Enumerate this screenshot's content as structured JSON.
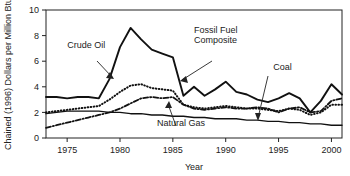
{
  "chart_data": {
    "type": "line",
    "title": "",
    "xlabel": "Year",
    "ylabel": "Chained (1996) Dollars per Million Btu",
    "xlim": [
      1973,
      2001
    ],
    "ylim": [
      0,
      10
    ],
    "xticks": [
      1975,
      1980,
      1985,
      1990,
      1995,
      2000
    ],
    "yticks": [
      0,
      2,
      4,
      6,
      8,
      10
    ],
    "xtick_labels": [
      "1975",
      "1980",
      "1985",
      "1990",
      "1995",
      "2000"
    ],
    "ytick_labels": [
      "0",
      "2",
      "4",
      "6",
      "8",
      "10"
    ],
    "grid": false,
    "legend": "annotations",
    "x": [
      1973,
      1974,
      1975,
      1976,
      1977,
      1978,
      1979,
      1980,
      1981,
      1982,
      1983,
      1984,
      1985,
      1986,
      1987,
      1988,
      1989,
      1990,
      1991,
      1992,
      1993,
      1994,
      1995,
      1996,
      1997,
      1998,
      1999,
      2000,
      2001
    ],
    "series": [
      {
        "name": "Crude Oil",
        "style": "solid-thick",
        "values": [
          3.2,
          3.2,
          3.1,
          3.2,
          3.2,
          3.1,
          4.6,
          7.1,
          8.6,
          7.7,
          6.9,
          6.6,
          6.3,
          3.3,
          4.0,
          3.3,
          3.8,
          4.4,
          3.6,
          3.4,
          3.0,
          2.8,
          3.1,
          3.5,
          3.1,
          2.0,
          2.9,
          4.2,
          3.4
        ]
      },
      {
        "name": "Fossil Fuel Composite",
        "style": "dotted",
        "values": [
          2.0,
          2.1,
          2.2,
          2.3,
          2.4,
          2.5,
          3.0,
          3.6,
          4.1,
          4.2,
          3.9,
          3.8,
          3.7,
          2.6,
          2.4,
          2.3,
          2.4,
          2.5,
          2.4,
          2.3,
          2.3,
          2.2,
          2.1,
          2.3,
          2.2,
          1.8,
          2.0,
          2.6,
          2.6
        ]
      },
      {
        "name": "Natural Gas",
        "style": "dash-dot",
        "values": [
          0.8,
          1.0,
          1.2,
          1.4,
          1.6,
          1.8,
          2.0,
          2.3,
          2.7,
          3.1,
          3.2,
          3.1,
          3.2,
          2.6,
          2.3,
          2.2,
          2.3,
          2.4,
          2.3,
          2.3,
          2.4,
          2.3,
          2.0,
          2.3,
          2.4,
          2.0,
          2.1,
          2.9,
          3.1
        ]
      },
      {
        "name": "Coal",
        "style": "solid-thin",
        "values": [
          1.9,
          2.0,
          2.1,
          2.1,
          2.1,
          2.1,
          2.0,
          2.0,
          1.9,
          1.9,
          1.8,
          1.8,
          1.7,
          1.7,
          1.6,
          1.6,
          1.5,
          1.5,
          1.5,
          1.4,
          1.4,
          1.3,
          1.3,
          1.2,
          1.2,
          1.1,
          1.1,
          1.0,
          1.0
        ]
      }
    ],
    "annotations": [
      {
        "name": "crude-oil-label",
        "text": "Crude Oil",
        "x": 1975.0,
        "y": 7.0
      },
      {
        "name": "fossil-fuel-composite-label",
        "text": "Fossil Fuel Composite",
        "x": 1987.0,
        "y": 8.2
      },
      {
        "name": "coal-label",
        "text": "Coal",
        "x": 1994.5,
        "y": 5.3
      },
      {
        "name": "natural-gas-label",
        "text": "Natural Gas",
        "x": 1983.5,
        "y": 0.95
      }
    ]
  }
}
